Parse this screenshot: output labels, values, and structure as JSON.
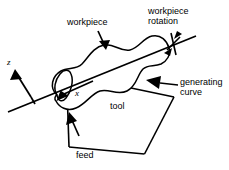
{
  "figure": {
    "type": "technical-line-diagram",
    "background_color": "#ffffff",
    "line_color": "#000000",
    "width": 229,
    "height": 170
  },
  "labels": {
    "workpiece": "workpiece",
    "workpiece_rotation_line1": "workpiece",
    "workpiece_rotation_line2": "rotation",
    "generating_line1": "generating",
    "generating_line2": "curve",
    "tool": "tool",
    "feed": "feed",
    "axis_z": "z",
    "axis_x": "x"
  },
  "annotations": [
    {
      "name": "workpiece",
      "text": "workpiece",
      "leader": "arrow pointing down-right onto the wavy workpiece outline",
      "arrow_from": [
        98,
        31
      ],
      "arrow_to": [
        107,
        49
      ]
    },
    {
      "name": "workpiece-rotation",
      "text": "workpiece rotation",
      "leader": "double-headed arrow across the rotation axis",
      "arrow_from": [
        166,
        52
      ],
      "arrow_to": [
        179,
        36
      ]
    },
    {
      "name": "generating-curve",
      "text": "generating curve",
      "leader": "horizontal leader line with arrowhead pointing left at the profile",
      "arrow_from": [
        178,
        84
      ],
      "arrow_to": [
        150,
        82
      ]
    },
    {
      "name": "tool",
      "text": "tool",
      "leader": "none — label sits inside the tool parallelogram"
    },
    {
      "name": "feed",
      "text": "feed",
      "leader": "arrow pointing up into the tool body",
      "arrow_from": [
        78,
        135
      ],
      "arrow_to": [
        69,
        113
      ]
    },
    {
      "name": "axis-z",
      "text": "z",
      "leader": "arrow pointing up-left",
      "arrow_from": [
        31,
        96
      ],
      "arrow_to": [
        14,
        71
      ]
    },
    {
      "name": "axis-x",
      "text": "x",
      "leader": "arrow pointing down-left along the rotation axis",
      "arrow_from": [
        92,
        82
      ],
      "arrow_to": [
        60,
        98
      ]
    }
  ],
  "geometry": {
    "rotation_axis": {
      "from": [
        8,
        112
      ],
      "to": [
        196,
        36
      ]
    },
    "tool_parallelogram": [
      [
        66,
        74
      ],
      [
        174,
        97
      ],
      [
        144,
        154
      ],
      [
        69,
        147
      ]
    ],
    "workpiece_outline": "closed wavy (sinusoidal) profile body of revolution straddling the rotation axis"
  }
}
